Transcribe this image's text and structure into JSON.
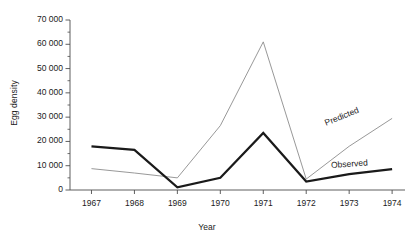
{
  "chart_data": {
    "type": "line",
    "title": "",
    "xlabel": "Year",
    "ylabel": "Egg density",
    "x": [
      1967,
      1968,
      1969,
      1970,
      1971,
      1972,
      1973,
      1974
    ],
    "xtick_labels": [
      "1967",
      "1968",
      "1969",
      "1970",
      "1971",
      "1972",
      "1973",
      "1974"
    ],
    "ylim": [
      0,
      70000
    ],
    "xlim": [
      1966.5,
      1974.3
    ],
    "ytick_values": [
      0,
      10000,
      20000,
      30000,
      40000,
      50000,
      60000,
      70000
    ],
    "ytick_labels": [
      "0",
      "10 000",
      "20 000",
      "30 000",
      "40 000",
      "50 000",
      "60 000",
      "70 000"
    ],
    "yminor_values": [
      5000,
      15000,
      25000,
      35000,
      45000,
      55000,
      65000
    ],
    "grid": false,
    "legend_position": "inline-right",
    "series": [
      {
        "name": "Observed",
        "label": "Observed",
        "color": "#1a1a1a",
        "width": 2.2,
        "values": [
          18000,
          16500,
          1100,
          5000,
          23500,
          3500,
          6500,
          8600
        ]
      },
      {
        "name": "Predicted",
        "label": "Predicted",
        "color": "#8c8c8c",
        "width": 0.9,
        "values": [
          8800,
          7000,
          5000,
          26500,
          61000,
          4500,
          18000,
          29500
        ]
      }
    ],
    "annotations": [
      {
        "text": "Predicted",
        "near_x": 1973.0,
        "near_y": 20000
      },
      {
        "text": "Observed",
        "near_x": 1973.2,
        "near_y": 9000
      }
    ]
  },
  "axes": {
    "y_axis_name": "y-axis",
    "x_axis_name": "x-axis"
  },
  "colors": {
    "observed": "#1a1a1a",
    "predicted": "#8c8c8c",
    "axis": "#4d4d4d",
    "text": "#1b1b1b",
    "background": "#ffffff"
  }
}
